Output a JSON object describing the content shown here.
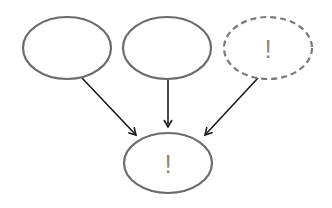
{
  "diagram": {
    "nodes": [
      {
        "id": "n1",
        "label": "",
        "style": "solid"
      },
      {
        "id": "n2",
        "label": "",
        "style": "solid"
      },
      {
        "id": "n3",
        "label": "!",
        "style": "dashed"
      },
      {
        "id": "n4",
        "label": "!",
        "style": "solid"
      }
    ],
    "edges": [
      {
        "from": "n1",
        "to": "n4"
      },
      {
        "from": "n2",
        "to": "n4"
      },
      {
        "from": "n3",
        "to": "n4"
      }
    ],
    "colors": {
      "node_stroke": "#6b6b6b",
      "edge": "#1a1a1a",
      "mark": "#8a8a8a"
    }
  }
}
